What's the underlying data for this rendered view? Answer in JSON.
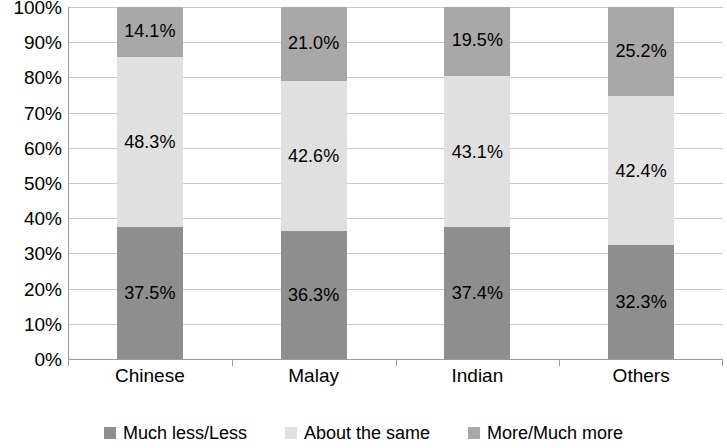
{
  "chart_data": {
    "type": "bar",
    "stacked": true,
    "stack_mode": "percent",
    "title": "",
    "subtitle": "",
    "xlabel": "",
    "ylabel": "",
    "ylim": [
      0,
      100
    ],
    "grid": true,
    "legend_position": "bottom",
    "categories": [
      "Chinese",
      "Malay",
      "Indian",
      "Others"
    ],
    "series": [
      {
        "name": "Much less/Less",
        "color": "#8e8e8e",
        "values": [
          37.5,
          36.3,
          37.4,
          32.3
        ],
        "labels": [
          "37.5%",
          "36.3%",
          "37.4%",
          "32.3%"
        ]
      },
      {
        "name": "About the same",
        "color": "#e0e0e0",
        "values": [
          48.3,
          42.6,
          43.1,
          42.4
        ],
        "labels": [
          "48.3%",
          "42.6%",
          "43.1%",
          "42.4%"
        ]
      },
      {
        "name": "More/Much more",
        "color": "#a8a8a8",
        "values": [
          14.1,
          21.0,
          19.5,
          25.2
        ],
        "labels": [
          "14.1%",
          "21.0%",
          "19.5%",
          "25.2%"
        ]
      }
    ],
    "y_ticks": [
      0,
      10,
      20,
      30,
      40,
      50,
      60,
      70,
      80,
      90,
      100
    ],
    "y_tick_labels": [
      "0%",
      "10%",
      "20%",
      "30%",
      "40%",
      "50%",
      "60%",
      "70%",
      "80%",
      "90%",
      "100%"
    ]
  },
  "axes": {
    "y_labels": [
      "100%",
      "90%",
      "80%",
      "70%",
      "60%",
      "50%",
      "40%",
      "30%",
      "20%",
      "10%",
      "0%"
    ],
    "x_labels": [
      "Chinese",
      "Malay",
      "Indian",
      "Others"
    ]
  },
  "legend": {
    "items": [
      {
        "label": "Much less/Less",
        "color": "#8e8e8e"
      },
      {
        "label": "About the same",
        "color": "#e0e0e0"
      },
      {
        "label": "More/Much more",
        "color": "#a8a8a8"
      }
    ]
  }
}
